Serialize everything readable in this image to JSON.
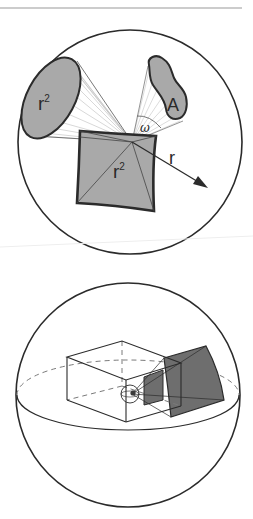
{
  "header": {
    "rule_color": "#9a9a9a"
  },
  "figure_top": {
    "title": "Solid angle diagram",
    "labels": {
      "ellipse_area": "r",
      "ellipse_area_exp": "2",
      "blob_area": "A",
      "angle": "ω",
      "square_area": "r",
      "square_area_exp": "2",
      "radius": "r"
    },
    "colors": {
      "outline": "#2b2b2b",
      "fill": "#a9a9a9",
      "ray": "#b8b8b8"
    }
  },
  "figure_bottom": {
    "title": "Steradian projection onto sphere",
    "colors": {
      "outline": "#2b2b2b",
      "fill": "#6e6e6e",
      "dash": "#7a7a7a"
    }
  }
}
